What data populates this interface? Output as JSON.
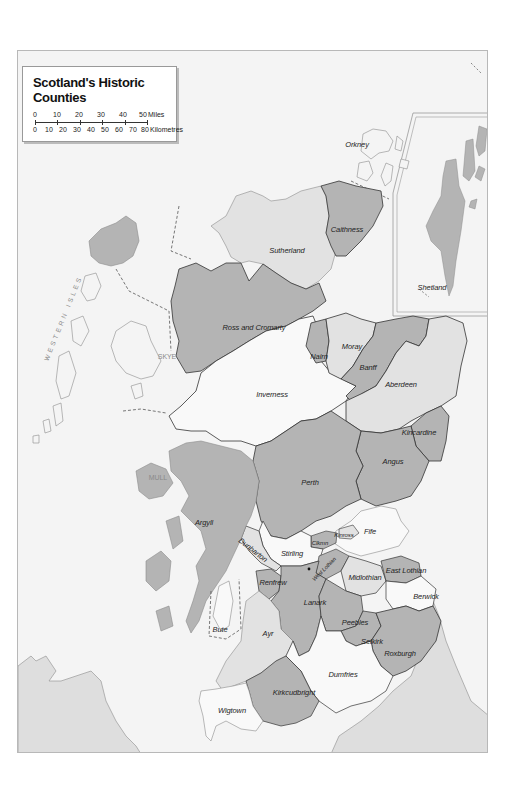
{
  "legend": {
    "title": "Scotland's Historic Counties",
    "scale": {
      "miles_ticks": [
        "0",
        "10",
        "20",
        "30",
        "40",
        "50"
      ],
      "miles_unit": "Miles",
      "km_ticks": [
        "0",
        "10",
        "20",
        "30",
        "40",
        "50",
        "60",
        "70",
        "80"
      ],
      "km_unit": "Kilometres"
    }
  },
  "colors": {
    "page": "#ffffff",
    "sea": "#f4f4f4",
    "dark_county": "#b4b4b4",
    "light_county": "#e2e2e2",
    "white_county": "#f9f9f9",
    "other_land": "#dedede",
    "border": "#333333",
    "coast": "#8c8c8c"
  },
  "labels": {
    "orkney": "Orkney",
    "shetland": "Shetland",
    "caithness": "Caithness",
    "sutherland": "Sutherland",
    "ross": "Ross and Cromarty",
    "nairn": "Nairn",
    "moray": "Moray",
    "banff": "Banff",
    "aberdeen": "Aberdeen",
    "inverness": "Inverness",
    "kincardine": "Kincardine",
    "angus": "Angus",
    "perth": "Perth",
    "fife": "Fife",
    "kinross": "Kinross",
    "clackmannan": "Clkmn",
    "stirling": "Stirling",
    "dunbarton": "Dunbarton",
    "argyll": "Argyll",
    "west_lothian": "West Lothian",
    "midlothian": "Midlothian",
    "east_lothian": "East Lothian",
    "berwick": "Berwick",
    "renfrew": "Renfrew",
    "lanark": "Lanark",
    "peebles": "Peebles",
    "selkirk": "Selkirk",
    "roxburgh": "Roxburgh",
    "bute": "Bute",
    "ayr": "Ayr",
    "dumfries": "Dumfries",
    "kirkcudbright": "Kirkcudbright",
    "wigtown": "Wigtown",
    "skye": "SKYE",
    "mull": "MULL",
    "western_isles": "WESTERN ISLES"
  }
}
